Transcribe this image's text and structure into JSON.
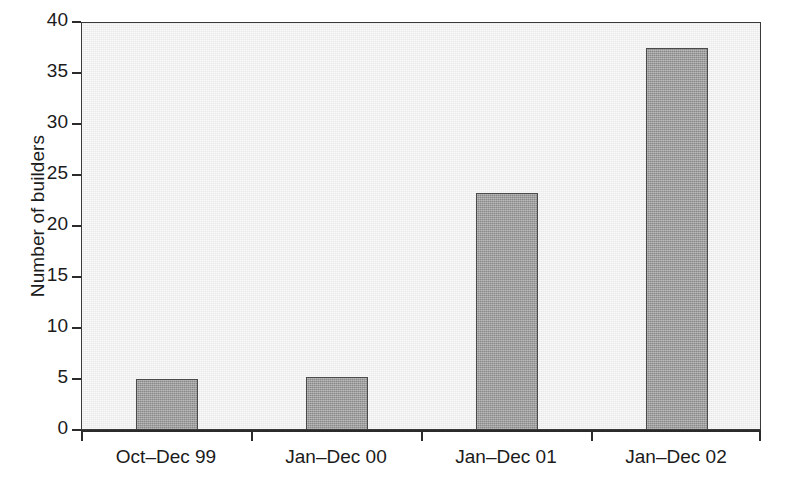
{
  "chart_data": {
    "type": "bar",
    "title": "",
    "subtitle": "",
    "xlabel": "",
    "ylabel": "Number of builders",
    "categories": [
      "Oct–Dec 99",
      "Jan–Dec 00",
      "Jan–Dec 01",
      "Jan–Dec 02"
    ],
    "values": [
      4.9,
      5.1,
      23.1,
      37.4
    ],
    "series": [
      {
        "name": "Number of builders",
        "values": [
          4.9,
          5.1,
          23.1,
          37.4
        ]
      }
    ],
    "ylim": [
      0,
      40
    ],
    "xlim": [
      0,
      4
    ],
    "ytick_labels": [
      "0",
      "5",
      "10",
      "15",
      "20",
      "25",
      "30",
      "35",
      "40"
    ],
    "ytick_values": [
      0,
      5,
      10,
      15,
      20,
      25,
      30,
      35,
      40
    ],
    "ytick_step": 5,
    "grid": false,
    "legend": false,
    "legend_position": "none",
    "annotations": [],
    "colors": {
      "bar_fill": "#9a9a9a",
      "bar_edge": "#4a4a4a",
      "plot_background": "#e9e9e9",
      "axis": "#2b2b2b",
      "text": "#1b1b1b",
      "page_background": "#ffffff"
    }
  }
}
